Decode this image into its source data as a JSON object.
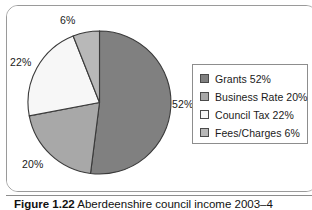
{
  "figure": {
    "caption_number": "Figure 1.22",
    "caption_text": "Aberdeenshire council income 2003–4",
    "frame_border_color": "#9a9a9a",
    "background_color": "#ffffff"
  },
  "legend": {
    "border_color": "#8d8d8d",
    "items": [
      {
        "label": "Grants 52%",
        "color": "#808080"
      },
      {
        "label": "Business Rate 20%",
        "color": "#a8a8a8"
      },
      {
        "label": "Council Tax 22%",
        "color": "#f7f7f7"
      },
      {
        "label": "Fees/Charges 6%",
        "color": "#b8b8b8"
      }
    ]
  },
  "pie_labels": {
    "grants": "52%",
    "business_rate": "20%",
    "council_tax": "22%",
    "fees_charges": "6%"
  },
  "chart_data": {
    "type": "pie",
    "title": "Aberdeenshire council income 2003–4",
    "categories": [
      "Grants",
      "Business Rate",
      "Council Tax",
      "Fees/Charges"
    ],
    "values": [
      52,
      20,
      22,
      6
    ],
    "value_unit": "%",
    "data_labels": [
      "52%",
      "20%",
      "22%",
      "6%"
    ],
    "colors": [
      "#808080",
      "#a8a8a8",
      "#f7f7f7",
      "#b8b8b8"
    ],
    "slice_edge_color": "#3a3a3a",
    "legend_entries": [
      "Grants 52%",
      "Business Rate 20%",
      "Council Tax 22%",
      "Fees/Charges 6%"
    ],
    "legend_position": "right",
    "start_angle_deg": 0,
    "direction": "clockwise",
    "grid": false,
    "xlabel": "",
    "ylabel": ""
  }
}
